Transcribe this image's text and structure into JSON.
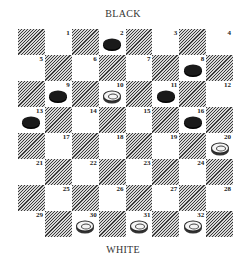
{
  "labels": {
    "top": "BLACK",
    "bottom": "WHITE"
  },
  "board": {
    "rows": 8,
    "cols": 8,
    "squares": [
      [
        {
          "c": "dark"
        },
        {
          "c": "light",
          "n": "1"
        },
        {
          "c": "dark"
        },
        {
          "c": "light",
          "n": "2",
          "p": "black"
        },
        {
          "c": "dark"
        },
        {
          "c": "light",
          "n": "3"
        },
        {
          "c": "dark"
        },
        {
          "c": "light",
          "n": "4"
        }
      ],
      [
        {
          "c": "light",
          "n": "5"
        },
        {
          "c": "dark"
        },
        {
          "c": "light",
          "n": "6"
        },
        {
          "c": "dark"
        },
        {
          "c": "light",
          "n": "7"
        },
        {
          "c": "dark"
        },
        {
          "c": "light",
          "n": "8",
          "p": "black"
        },
        {
          "c": "dark"
        }
      ],
      [
        {
          "c": "dark"
        },
        {
          "c": "light",
          "n": "9",
          "p": "black"
        },
        {
          "c": "dark"
        },
        {
          "c": "light",
          "n": "10",
          "p": "white"
        },
        {
          "c": "dark"
        },
        {
          "c": "light",
          "n": "11",
          "p": "black"
        },
        {
          "c": "dark"
        },
        {
          "c": "light",
          "n": "12"
        }
      ],
      [
        {
          "c": "light",
          "n": "13",
          "p": "black"
        },
        {
          "c": "dark"
        },
        {
          "c": "light",
          "n": "14"
        },
        {
          "c": "dark"
        },
        {
          "c": "light",
          "n": "15"
        },
        {
          "c": "dark"
        },
        {
          "c": "light",
          "n": "16",
          "p": "black"
        },
        {
          "c": "dark"
        }
      ],
      [
        {
          "c": "dark"
        },
        {
          "c": "light",
          "n": "17"
        },
        {
          "c": "dark"
        },
        {
          "c": "light",
          "n": "18"
        },
        {
          "c": "dark"
        },
        {
          "c": "light",
          "n": "19"
        },
        {
          "c": "dark"
        },
        {
          "c": "light",
          "n": "20",
          "p": "white"
        }
      ],
      [
        {
          "c": "light",
          "n": "21"
        },
        {
          "c": "dark"
        },
        {
          "c": "light",
          "n": "22"
        },
        {
          "c": "dark"
        },
        {
          "c": "light",
          "n": "23"
        },
        {
          "c": "dark"
        },
        {
          "c": "light",
          "n": "24"
        },
        {
          "c": "dark"
        }
      ],
      [
        {
          "c": "dark"
        },
        {
          "c": "light",
          "n": "25"
        },
        {
          "c": "dark"
        },
        {
          "c": "light",
          "n": "26"
        },
        {
          "c": "dark"
        },
        {
          "c": "light",
          "n": "27"
        },
        {
          "c": "dark"
        },
        {
          "c": "light",
          "n": "28"
        }
      ],
      [
        {
          "c": "light",
          "n": "29"
        },
        {
          "c": "dark"
        },
        {
          "c": "light",
          "n": "30",
          "p": "white"
        },
        {
          "c": "dark"
        },
        {
          "c": "light",
          "n": "31",
          "p": "white"
        },
        {
          "c": "dark"
        },
        {
          "c": "light",
          "n": "32",
          "p": "white"
        },
        {
          "c": "dark"
        }
      ]
    ],
    "pieces": {
      "black": [
        "2",
        "8",
        "9",
        "11",
        "13",
        "16"
      ],
      "white": [
        "10",
        "20",
        "30",
        "31",
        "32"
      ]
    }
  }
}
